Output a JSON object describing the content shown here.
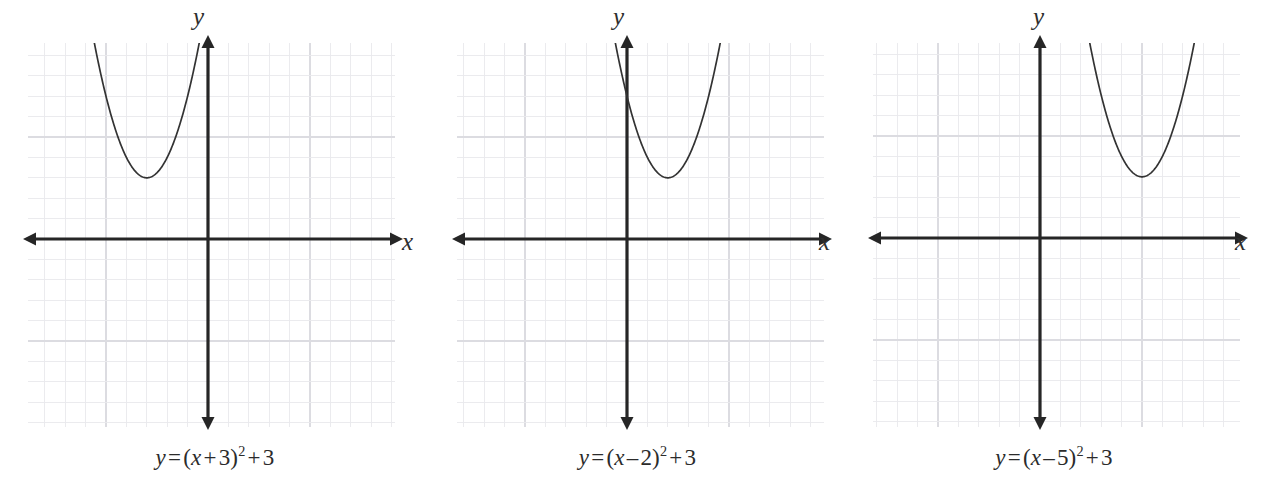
{
  "figure": {
    "background_color": "#ffffff",
    "width": 1263,
    "height": 497
  },
  "style": {
    "grid_minor_color": "#e9e9ec",
    "grid_major_color": "#dcdce1",
    "axis_color": "#262626",
    "curve_color": "#333333",
    "text_color": "#2b2b2b",
    "grid_spacing_px": 20.4
  },
  "axis_labels": {
    "x": "x",
    "y": "y"
  },
  "panels": [
    {
      "id": "panel-1",
      "equation_plain": "y = (x + 3)^2 + 3",
      "equation_parts": {
        "lhs": "y",
        "equals": "=",
        "open_paren": "(",
        "inner_var": "x",
        "inner_op": "+",
        "inner_const": "3",
        "close_paren": ")",
        "exponent": "2",
        "outer_op": "+",
        "outer_const": "3"
      },
      "x_label": "x",
      "y_label": "y"
    },
    {
      "id": "panel-2",
      "equation_plain": "y = (x – 2)^2 + 3",
      "equation_parts": {
        "lhs": "y",
        "equals": "=",
        "open_paren": "(",
        "inner_var": "x",
        "inner_op": "–",
        "inner_const": "2",
        "close_paren": ")",
        "exponent": "2",
        "outer_op": "+",
        "outer_const": "3"
      },
      "x_label": "x",
      "y_label": "y"
    },
    {
      "id": "panel-3",
      "equation_plain": "y = (x – 5)^2 + 3",
      "equation_parts": {
        "lhs": "y",
        "equals": "=",
        "open_paren": "(",
        "inner_var": "x",
        "inner_op": "–",
        "inner_const": "5",
        "close_paren": ")",
        "exponent": "2",
        "outer_op": "+",
        "outer_const": "3"
      },
      "x_label": "x",
      "y_label": "y"
    }
  ],
  "chart_data": [
    {
      "type": "line",
      "title": "y = (x + 3)^2 + 3",
      "xlabel": "x",
      "ylabel": "y",
      "equation": "y = (x + 3)^2 + 3",
      "form": "vertex",
      "a": 1,
      "h": -3,
      "k": 3,
      "vertex": [
        -3,
        3
      ],
      "axis_of_symmetry": -3,
      "opens": "up",
      "grid": true,
      "legend": "none",
      "xlim": [
        -8.6,
        9.9
      ],
      "ylim": [
        -9.1,
        9.5
      ],
      "x": [
        -6.1,
        -5.5,
        -5.0,
        -4.5,
        -4.0,
        -3.5,
        -3.0,
        -2.5,
        -2.0,
        -1.5,
        -1.0,
        -0.6
      ],
      "y": [
        12.6,
        9.25,
        7.0,
        5.25,
        4.0,
        3.25,
        3.0,
        3.25,
        4.0,
        5.25,
        7.0,
        8.76
      ]
    },
    {
      "type": "line",
      "title": "y = (x – 2)^2 + 3",
      "xlabel": "x",
      "ylabel": "y",
      "equation": "y = (x - 2)^2 + 3",
      "form": "vertex",
      "a": 1,
      "h": 2,
      "k": 3,
      "vertex": [
        2,
        3
      ],
      "axis_of_symmetry": 2,
      "opens": "up",
      "grid": true,
      "legend": "none",
      "xlim": [
        -9.3,
        9.2
      ],
      "ylim": [
        -9.1,
        9.5
      ],
      "x": [
        -0.5,
        0.0,
        0.5,
        1.0,
        1.5,
        2.0,
        2.5,
        3.0,
        3.5,
        4.0,
        4.5,
        4.6
      ],
      "y": [
        9.25,
        7.0,
        5.25,
        4.0,
        3.25,
        3.0,
        3.25,
        4.0,
        5.25,
        7.0,
        9.25,
        9.76
      ]
    },
    {
      "type": "line",
      "title": "y = (x – 5)^2 + 3",
      "xlabel": "x",
      "ylabel": "y",
      "equation": "y = (x - 5)^2 + 3",
      "form": "vertex",
      "a": 1,
      "h": 5,
      "k": 3,
      "vertex": [
        5,
        3
      ],
      "axis_of_symmetry": 5,
      "opens": "up",
      "grid": true,
      "legend": "none",
      "xlim": [
        -9.5,
        9.0
      ],
      "ylim": [
        -9.1,
        9.5
      ],
      "x": [
        2.5,
        3.0,
        3.5,
        4.0,
        4.5,
        5.0,
        5.5,
        6.0,
        6.5,
        7.0,
        7.5
      ],
      "y": [
        9.25,
        7.0,
        5.25,
        4.0,
        3.25,
        3.0,
        3.25,
        4.0,
        5.25,
        7.0,
        9.25
      ]
    }
  ]
}
